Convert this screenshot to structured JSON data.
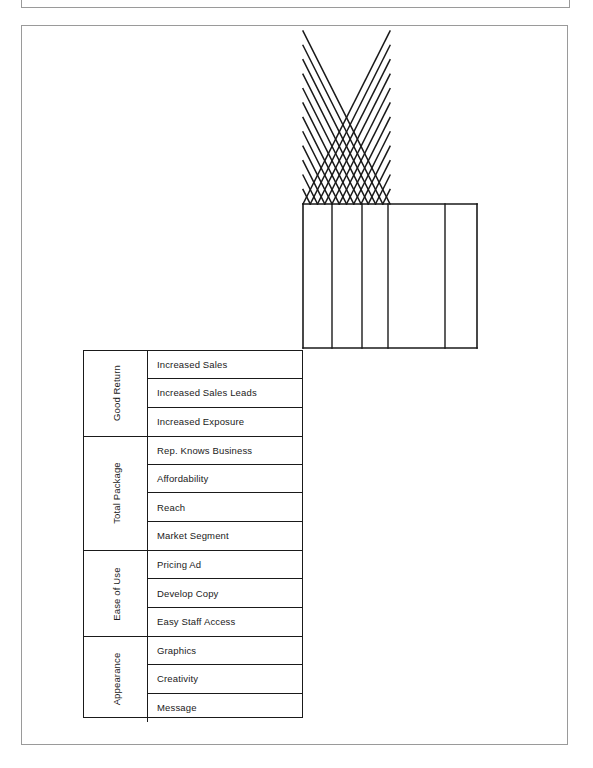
{
  "document": {
    "kind": "house-of-quality-diagram",
    "clipped_header_text": ""
  },
  "diagram": {
    "roof": {
      "label": "correlation-roof-lattice",
      "apex_x": 390,
      "base_y": 204,
      "base_left_x": 303,
      "base_right_x": 477,
      "diagonal_cells": 12
    },
    "body": {
      "label": "relationship-matrix-body",
      "left_x": 303,
      "right_x": 477,
      "top_y": 204,
      "bottom_y": 348,
      "column_divider_x": [
        332,
        362,
        388,
        445
      ],
      "columns": 5
    }
  },
  "matrix": {
    "groups": [
      {
        "label": "Good Return",
        "rows": [
          "Increased Sales",
          "Increased Sales Leads",
          "Increased Exposure"
        ]
      },
      {
        "label": "Total Package",
        "rows": [
          "Rep. Knows Business",
          "Affordability",
          "Reach",
          "Market Segment"
        ]
      },
      {
        "label": "Ease of  Use",
        "rows": [
          "Pricing Ad",
          "Develop Copy",
          "Easy Staff  Access"
        ]
      },
      {
        "label": "Appearance",
        "rows": [
          "Graphics",
          "Creativity",
          "Message"
        ]
      }
    ]
  },
  "colors": {
    "ink": "#1a1a1a",
    "frame": "#9a9a9a",
    "paper": "#ffffff"
  }
}
